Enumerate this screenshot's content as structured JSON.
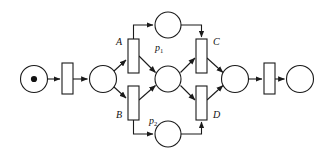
{
  "diagram": {
    "type": "petri-net",
    "title": "",
    "background_color": "#ffffff",
    "stroke_color": "#1a1a1a",
    "token_color": "#111111",
    "width": 327,
    "height": 158,
    "places": [
      {
        "id": "p_start",
        "label": "",
        "cx": 34,
        "cy": 79,
        "r": 13.5,
        "tokens": 1
      },
      {
        "id": "p_fork",
        "label": "",
        "cx": 103,
        "cy": 79,
        "r": 13.5,
        "tokens": 0
      },
      {
        "id": "p1",
        "label": "p",
        "subscript": "1",
        "cx": 168,
        "cy": 25,
        "r": 13.0,
        "tokens": 0
      },
      {
        "id": "p_mid",
        "label": "",
        "cx": 168,
        "cy": 79,
        "r": 13.0,
        "tokens": 0
      },
      {
        "id": "p2",
        "label": "p",
        "subscript": "2",
        "cx": 168,
        "cy": 134,
        "r": 13.0,
        "tokens": 0
      },
      {
        "id": "p_join",
        "label": "",
        "cx": 235,
        "cy": 79,
        "r": 13.5,
        "tokens": 0
      },
      {
        "id": "p_end",
        "label": "",
        "cx": 300,
        "cy": 79,
        "r": 13.5,
        "tokens": 0
      }
    ],
    "transitions": [
      {
        "id": "t_start",
        "label": "",
        "x": 62,
        "y": 63,
        "w": 11,
        "h": 31
      },
      {
        "id": "t_A",
        "label": "A",
        "x": 128,
        "y": 39,
        "w": 11,
        "h": 34
      },
      {
        "id": "t_B",
        "label": "B",
        "x": 128,
        "y": 86,
        "w": 11,
        "h": 34
      },
      {
        "id": "t_C",
        "label": "C",
        "x": 196,
        "y": 39,
        "w": 11,
        "h": 34
      },
      {
        "id": "t_D",
        "label": "D",
        "x": 196,
        "y": 86,
        "w": 11,
        "h": 34
      },
      {
        "id": "t_end",
        "label": "",
        "x": 264,
        "y": 63,
        "w": 11,
        "h": 31
      }
    ],
    "labels": [
      {
        "id": "label-A",
        "text": "A",
        "x": 120,
        "y": 45,
        "anchor": "end"
      },
      {
        "id": "label-B",
        "text": "B",
        "x": 120,
        "y": 117,
        "anchor": "end"
      },
      {
        "id": "label-C",
        "text": "C",
        "x": 214,
        "y": 45,
        "anchor": "start"
      },
      {
        "id": "label-D",
        "text": "D",
        "x": 214,
        "y": 117,
        "anchor": "start"
      },
      {
        "id": "label-p1",
        "text": "p",
        "subscript": "1",
        "x": 156,
        "y": 50,
        "anchor": "start"
      },
      {
        "id": "label-p2",
        "text": "p",
        "subscript": "2",
        "x": 150,
        "y": 123,
        "anchor": "start"
      }
    ],
    "arcs": [
      {
        "id": "arc-start-to-t0",
        "from": "p_start",
        "to": "t_start"
      },
      {
        "id": "arc-t0-to-pfork",
        "from": "t_start",
        "to": "p_fork"
      },
      {
        "id": "arc-pfork-to-A",
        "from": "p_fork",
        "to": "t_A"
      },
      {
        "id": "arc-pfork-to-B",
        "from": "p_fork",
        "to": "t_B"
      },
      {
        "id": "arc-A-to-p1",
        "from": "t_A",
        "to": "p1"
      },
      {
        "id": "arc-A-to-pmid",
        "from": "t_A",
        "to": "p_mid"
      },
      {
        "id": "arc-B-to-p2",
        "from": "t_B",
        "to": "p2"
      },
      {
        "id": "arc-B-to-pmid",
        "from": "t_B",
        "to": "p_mid"
      },
      {
        "id": "arc-p1-to-C",
        "from": "p1",
        "to": "t_C"
      },
      {
        "id": "arc-pmid-to-C",
        "from": "p_mid",
        "to": "t_C"
      },
      {
        "id": "arc-pmid-to-D",
        "from": "p_mid",
        "to": "t_D"
      },
      {
        "id": "arc-p2-to-D",
        "from": "p2",
        "to": "t_D"
      },
      {
        "id": "arc-C-to-pjoin",
        "from": "t_C",
        "to": "p_join"
      },
      {
        "id": "arc-D-to-pjoin",
        "from": "t_D",
        "to": "p_join"
      },
      {
        "id": "arc-pjoin-to-tend",
        "from": "p_join",
        "to": "t_end"
      },
      {
        "id": "arc-tend-to-pend",
        "from": "t_end",
        "to": "p_end"
      }
    ]
  }
}
